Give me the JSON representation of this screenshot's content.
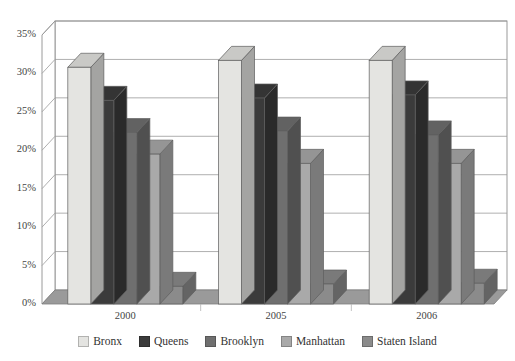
{
  "title": "",
  "axis": {
    "y_ticks": [
      "0%",
      "5%",
      "10%",
      "15%",
      "20%",
      "25%",
      "30%",
      "35%"
    ],
    "x_ticks": [
      "2000",
      "2005",
      "2006"
    ]
  },
  "legend": {
    "items": [
      {
        "label": "Bronx",
        "color": "#e4e4e1"
      },
      {
        "label": "Queens",
        "color": "#3b3b3b"
      },
      {
        "label": "Brooklyn",
        "color": "#6f6f6f"
      },
      {
        "label": "Manhattan",
        "color": "#a9a9a9"
      },
      {
        "label": "Staten Island",
        "color": "#8b8b8b"
      }
    ]
  },
  "chart_data": {
    "type": "bar",
    "title": "",
    "xlabel": "",
    "ylabel": "",
    "categories": [
      "2000",
      "2005",
      "2006"
    ],
    "ylim": [
      0,
      35
    ],
    "y_tick_step": 5,
    "y_tick_format": "percent",
    "grid": true,
    "legend_position": "bottom",
    "style": "3d-clustered-column",
    "series": [
      {
        "name": "Bronx",
        "color": "#e4e4e1",
        "values": [
          30.8,
          31.7,
          31.7
        ]
      },
      {
        "name": "Queens",
        "color": "#3b3b3b",
        "values": [
          26.5,
          26.8,
          27.2
        ]
      },
      {
        "name": "Brooklyn",
        "color": "#6f6f6f",
        "values": [
          22.3,
          22.5,
          22.0
        ]
      },
      {
        "name": "Manhattan",
        "color": "#a9a9a9",
        "values": [
          19.5,
          18.3,
          18.3
        ]
      },
      {
        "name": "Staten Island",
        "color": "#8b8b8b",
        "values": [
          2.3,
          2.6,
          2.7
        ]
      }
    ]
  }
}
